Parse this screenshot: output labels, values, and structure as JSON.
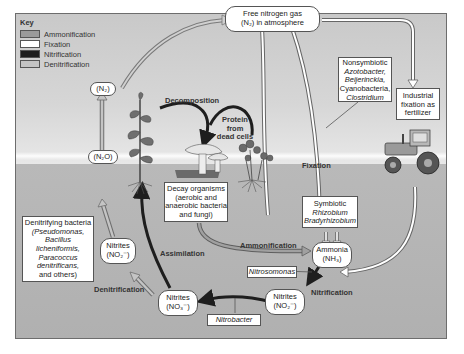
{
  "key": {
    "title": "Key",
    "items": [
      {
        "label": "Ammonification",
        "color": "#9a9a9a"
      },
      {
        "label": "Fixation",
        "color": "#ffffff"
      },
      {
        "label": "Nitrification",
        "color": "#1e1e1e"
      },
      {
        "label": "Denitrification",
        "color": "#c4c4c4"
      }
    ]
  },
  "nodes": {
    "free_n2": {
      "line1": "Free nitrogen gas",
      "line2": "(N₂) in atmosphere"
    },
    "n2_left": {
      "label": "(N₂)"
    },
    "n2o": {
      "label": "(N₂O)"
    },
    "nitrites_left": {
      "line1": "Nitrites",
      "line2": "(NO₂⁻)"
    },
    "nitrates_bottom": {
      "line1": "Nitrites",
      "line2": "(NO₃⁻)"
    },
    "nitrites_right": {
      "line1": "Nitrites",
      "line2": "(NO₂⁻)"
    },
    "ammonia": {
      "line1": "Ammonia",
      "line2": "(NH₃)"
    }
  },
  "boxes": {
    "nonsymbiotic": {
      "line1": "Nonsymbiotic",
      "line2": "Azotobacter,",
      "line3": "Beijerinckia,",
      "line4": "Cyanobacteria,",
      "line5": "Clostridium"
    },
    "industrial": {
      "line1": "Industrial",
      "line2": "fixation as",
      "line3": "fertilizer"
    },
    "decay": {
      "line1": "Decay organisms",
      "line2": "(aerobic and",
      "line3": "anaerobic bacteria",
      "line4": "and fungi)"
    },
    "symbiotic": {
      "line1": "Symbiotic",
      "line2": "Rhizobium",
      "line3": "Bradyrhizobium"
    },
    "denitrifying": {
      "line1": "Denitrifying bacteria",
      "line2": "(Pseudomonas,",
      "line3": "Bacillus",
      "line4": "licheniformis,",
      "line5": "Paracoccus",
      "line6": "denitrificans,",
      "line7": "and others)"
    },
    "nitrosomonas": {
      "label": "Nitrosomonas"
    },
    "nitrobacter": {
      "label": "Nitrobacter"
    }
  },
  "labels": {
    "decomposition": "Decomposition",
    "protein": {
      "line1": "Protein",
      "line2": "from",
      "line3": "dead cells"
    },
    "fixation": "Fixation",
    "ammonification": "Ammonification",
    "assimilation": "Assimilation",
    "denitrification": "Denitrification",
    "nitrification": "Nitrification"
  }
}
